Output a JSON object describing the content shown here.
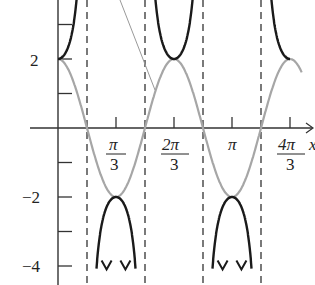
{
  "chart_data": {
    "type": "line",
    "title": "",
    "xlabel": "x",
    "ylabel": "",
    "series": [
      {
        "name": "y = 2cos(3x)",
        "color": "#a6a6a6",
        "function": "2*cos(3x)"
      },
      {
        "name": "y = 2sec(3x)",
        "color": "#1a1a1a",
        "function": "2/cos(3x)"
      }
    ],
    "asymptotes_x": [
      "π/6",
      "π/2",
      "5π/6",
      "7π/6"
    ],
    "x_ticks": [
      {
        "value": "π/3",
        "num": "π",
        "den": "3"
      },
      {
        "value": "2π/3",
        "num": "2π",
        "den": "3"
      },
      {
        "value": "π",
        "num": "π",
        "den": ""
      },
      {
        "value": "4π/3",
        "num": "4π",
        "den": "3"
      }
    ],
    "y_ticks": [
      "2",
      "−2",
      "−4"
    ],
    "xlim": [
      -0.05,
      4.4
    ],
    "ylim": [
      -4.5,
      3.8
    ],
    "grid": false
  },
  "labels": {
    "y2": "2",
    "ym2": "−2",
    "ym4": "−4",
    "pi": "π",
    "three": "3",
    "two_pi": "2π",
    "four_pi": "4π",
    "x_axis": "x"
  }
}
